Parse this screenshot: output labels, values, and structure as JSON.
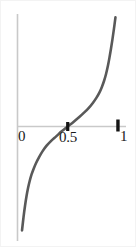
{
  "figure": {
    "background_color": "#ffffff",
    "width": 136,
    "height": 247
  },
  "axes": {
    "color": "#c9c9c9",
    "x_axis_name": "horizontal-axis",
    "y_axis_name": "vertical-axis",
    "tick_color": "#141414",
    "tick_labels": [
      {
        "text": "0",
        "value": 0
      },
      {
        "text": "0.5",
        "value": 0.5
      },
      {
        "text": "1",
        "value": 1
      }
    ]
  },
  "chart_data": {
    "type": "line",
    "title": "",
    "subtitle": "",
    "xlabel": "",
    "ylabel": "",
    "xlim": [
      0,
      1.08
    ],
    "ylim": [
      -1.25,
      1.25
    ],
    "grid": false,
    "legend": null,
    "annotations": [],
    "xticks": [
      0,
      0.5,
      1
    ],
    "xticklabels": [
      "0",
      "0.5",
      "1"
    ],
    "yticks": [],
    "yticklabels": [],
    "series": [
      {
        "name": "sigmoid-s-curve",
        "color": "#595959",
        "linewidth": 2.6,
        "x": [
          0.045,
          0.06,
          0.075,
          0.09,
          0.105,
          0.12,
          0.14,
          0.16,
          0.185,
          0.215,
          0.25,
          0.29,
          0.335,
          0.385,
          0.44,
          0.5,
          0.56,
          0.615,
          0.665,
          0.71,
          0.75,
          0.785,
          0.815,
          0.84,
          0.862,
          0.882,
          0.9,
          0.915,
          0.93,
          0.945,
          0.96,
          0.975
        ],
        "y": [
          -1.18,
          -1.03,
          -0.9,
          -0.79,
          -0.7,
          -0.625,
          -0.545,
          -0.482,
          -0.415,
          -0.348,
          -0.28,
          -0.218,
          -0.163,
          -0.112,
          -0.055,
          0.0,
          0.055,
          0.108,
          0.16,
          0.212,
          0.268,
          0.325,
          0.385,
          0.45,
          0.52,
          0.6,
          0.69,
          0.78,
          0.88,
          0.99,
          1.11,
          1.24
        ]
      }
    ],
    "markers": [
      {
        "name": "tick-0.5",
        "x": 0.5,
        "y": 0,
        "shape": "square",
        "color": "#141414"
      },
      {
        "name": "tick-1",
        "x": 1.0,
        "y": 0,
        "shape": "square",
        "color": "#141414"
      }
    ]
  }
}
